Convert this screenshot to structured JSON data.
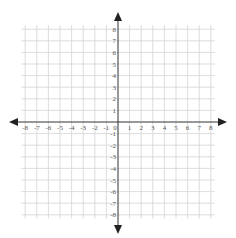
{
  "diagram": {
    "type": "cartesian-coordinate-plane",
    "x_axis": {
      "min": -8,
      "max": 8,
      "step": 1,
      "tick_labels": [
        "-8",
        "-7",
        "-6",
        "-5",
        "-4",
        "-3",
        "-2",
        "-1",
        "0",
        "1",
        "2",
        "3",
        "4",
        "5",
        "6",
        "7",
        "8"
      ]
    },
    "y_axis": {
      "min": -8,
      "max": 8,
      "step": 1,
      "tick_labels": [
        "8",
        "7",
        "6",
        "5",
        "4",
        "3",
        "2",
        "1",
        "-1",
        "-2",
        "-3",
        "-4",
        "-5",
        "-6",
        "-7",
        "-8"
      ]
    },
    "colors": {
      "grid": "#d4d4d4",
      "axis": "#333333",
      "label": "#555555",
      "background": "#ffffff"
    },
    "arrows": [
      "up",
      "down",
      "left",
      "right"
    ]
  }
}
